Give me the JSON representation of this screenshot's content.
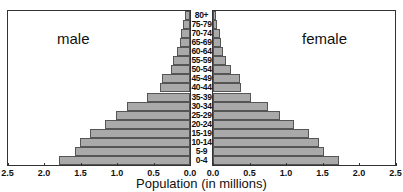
{
  "chart_data": {
    "type": "bar",
    "subtype": "population-pyramid",
    "title": "",
    "xlabel": "Population (in millions)",
    "ylabel": "",
    "xlim": [
      0,
      2.5
    ],
    "x_ticks_left": [
      "2.5",
      "2.0",
      "1.5",
      "1.0",
      "0.5",
      "0.0"
    ],
    "x_ticks_right": [
      "0.0",
      "0.5",
      "1.0",
      "1.5",
      "2.0",
      "2.5"
    ],
    "grid": false,
    "categories": [
      "80+",
      "75-79",
      "70-74",
      "65-69",
      "60-64",
      "55-59",
      "50-54",
      "45-49",
      "40-44",
      "35-39",
      "30-34",
      "25-29",
      "20-24",
      "15-19",
      "10-14",
      "5-9",
      "0-4"
    ],
    "series": [
      {
        "name": "male",
        "side": "left",
        "values": [
          0.07,
          0.1,
          0.12,
          0.14,
          0.18,
          0.23,
          0.26,
          0.38,
          0.41,
          0.59,
          0.86,
          1.01,
          1.16,
          1.37,
          1.51,
          1.58,
          1.79
        ]
      },
      {
        "name": "female",
        "side": "right",
        "values": [
          0.04,
          0.05,
          0.1,
          0.11,
          0.14,
          0.18,
          0.25,
          0.37,
          0.38,
          0.52,
          0.75,
          0.92,
          1.11,
          1.32,
          1.45,
          1.52,
          1.73
        ]
      }
    ],
    "colors": {
      "bar_fill": "#a9a9a9",
      "bar_edge": "#555555",
      "frame": "#333333"
    }
  },
  "labels": {
    "male": "male",
    "female": "female",
    "axis_title": "Population (in millions)"
  }
}
